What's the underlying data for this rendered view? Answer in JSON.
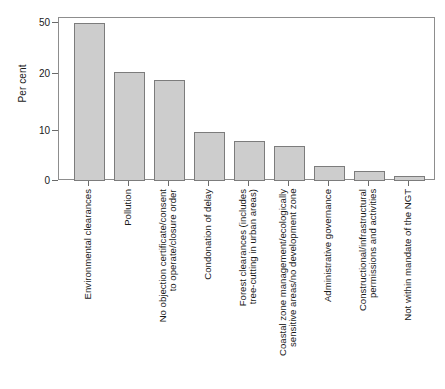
{
  "chart_data": {
    "type": "bar",
    "title": "",
    "xlabel": "",
    "ylabel": "Per cent",
    "ylim": [
      0,
      55
    ],
    "grid": false,
    "legend": null,
    "yticks": [
      0,
      10,
      20,
      50
    ],
    "ytick_labels": [
      "0",
      "10",
      "20",
      "50"
    ],
    "axis_note": "non-linear (compressed) y-axis: tick pixel positions 0,10,20,50 are not evenly proportional",
    "categories": [
      "Environmental clearances",
      "Pollution",
      "No objection certificate/consent to operate/closure order",
      "Condonation of delay",
      "Forest clearances (includes tree-cutting in urban areas)",
      "Coastal zone management/ecologically sensitive areas/no development zone",
      "Administrative governance",
      "Constructional/infrastructural permissions and activities",
      "Not within mandate of the NGT"
    ],
    "values": [
      49.8,
      21,
      19,
      9.8,
      8,
      7,
      3,
      2,
      1
    ],
    "bar_color": "#cdcdcd",
    "bar_edge_color": "#7c7c7c",
    "axis_color": "#8d8d8d"
  },
  "labels_wrapped": [
    [
      "Environmental clearances"
    ],
    [
      "Pollution"
    ],
    [
      "No objection certificate/consent",
      "to operate/closure order"
    ],
    [
      "Condonation of delay"
    ],
    [
      "Forest clearances (includes",
      "tree-cutting in urban areas)"
    ],
    [
      "Coastal zone management/ecologically",
      "sensitive areas/no development zone"
    ],
    [
      "Administrative governance"
    ],
    [
      "Constructional/infrastructural",
      "permissions and activities"
    ],
    [
      "Not within mandate of the NGT"
    ]
  ]
}
